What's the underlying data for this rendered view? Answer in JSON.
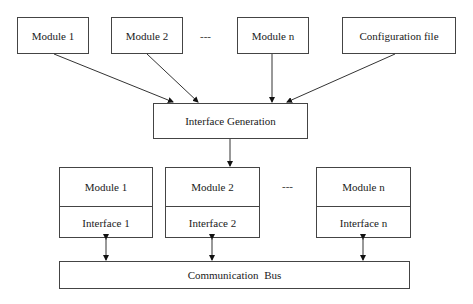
{
  "diagram": {
    "top_row": [
      {
        "label": "Module 1"
      },
      {
        "label": "Module 2"
      },
      {
        "label": "Module n"
      },
      {
        "label": "Configuration file"
      }
    ],
    "top_ellipsis": "---",
    "generator": {
      "label": "Interface Generation"
    },
    "bottom_row": [
      {
        "module": "Module 1",
        "interface": "Interface 1"
      },
      {
        "module": "Module 2",
        "interface": "Interface 2"
      },
      {
        "module": "Module n",
        "interface": "Interface n"
      }
    ],
    "bottom_ellipsis": "---",
    "bus": {
      "label": "Communication Bus"
    },
    "edges": [
      {
        "from": "Module 1",
        "to": "Interface Generation",
        "type": "directed"
      },
      {
        "from": "Module 2",
        "to": "Interface Generation",
        "type": "directed"
      },
      {
        "from": "Module n",
        "to": "Interface Generation",
        "type": "directed"
      },
      {
        "from": "Configuration file",
        "to": "Interface Generation",
        "type": "directed"
      },
      {
        "from": "Interface Generation",
        "to": "Module 2 (bottom)",
        "type": "directed"
      },
      {
        "from": "Interface 1",
        "to": "Communication Bus",
        "type": "bidirectional"
      },
      {
        "from": "Interface 2",
        "to": "Communication Bus",
        "type": "bidirectional"
      },
      {
        "from": "Interface n",
        "to": "Communication Bus",
        "type": "bidirectional"
      }
    ]
  }
}
